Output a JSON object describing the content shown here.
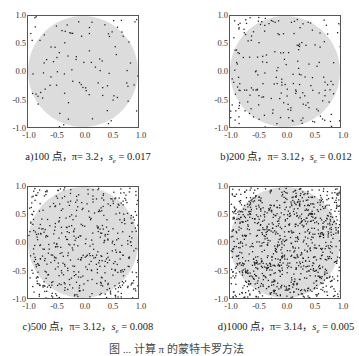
{
  "chart_data": [
    {
      "type": "scatter",
      "id": "a",
      "title": "a)100 点，π= 3.2，s_e = 0.017",
      "caption_prefix": "a)100 点，π= 3.2，",
      "caption_se_label": "s",
      "caption_se_sub": "e",
      "caption_se_value": " = 0.017",
      "n_points": 100,
      "pi_estimate": 3.2,
      "se": 0.017,
      "xlim": [
        -1.0,
        1.0
      ],
      "ylim": [
        -1.0,
        1.0
      ],
      "xticks": [
        "-1.0",
        "-0.5",
        "0.0",
        "0.5",
        "1.0"
      ],
      "yticks": [
        "1.0",
        "0.5",
        "0.0",
        "-0.5",
        "-1.0"
      ],
      "shaded_region": "unit circle",
      "seed": 11
    },
    {
      "type": "scatter",
      "id": "b",
      "title": "b)200 点，π= 3.12，s_e = 0.012",
      "caption_prefix": "b)200 点，π= 3.12，",
      "caption_se_label": "s",
      "caption_se_sub": "e",
      "caption_se_value": " = 0.012",
      "n_points": 200,
      "pi_estimate": 3.12,
      "se": 0.012,
      "xlim": [
        -1.0,
        1.0
      ],
      "ylim": [
        -1.0,
        1.0
      ],
      "xticks": [
        "-1.0",
        "-0.5",
        "0.0",
        "0.5",
        "1.0"
      ],
      "yticks": [
        "1.0",
        "0.5",
        "0.0",
        "-0.5",
        "-1.0"
      ],
      "shaded_region": "unit circle",
      "seed": 23
    },
    {
      "type": "scatter",
      "id": "c",
      "title": "c)500 点，π= 3.12，s_e = 0.008",
      "caption_prefix": "c)500 点，π= 3.12，",
      "caption_se_label": "s",
      "caption_se_sub": "e",
      "caption_se_value": " = 0.008",
      "n_points": 500,
      "pi_estimate": 3.12,
      "se": 0.008,
      "xlim": [
        -1.0,
        1.0
      ],
      "ylim": [
        -1.0,
        1.0
      ],
      "xticks": [
        "-1.0",
        "-0.5",
        "0.0",
        "0.5",
        "1.0"
      ],
      "yticks": [
        "1.0",
        "0.5",
        "0.0",
        "-0.5",
        "-1.0"
      ],
      "shaded_region": "unit circle",
      "seed": 37
    },
    {
      "type": "scatter",
      "id": "d",
      "title": "d)1000 点，π= 3.14，s_e = 0.005",
      "caption_prefix": "d)1000 点，π= 3.14，",
      "caption_se_label": "s",
      "caption_se_sub": "e",
      "caption_se_value": " = 0.005",
      "n_points": 1000,
      "pi_estimate": 3.14,
      "se": 0.005,
      "xlim": [
        -1.0,
        1.0
      ],
      "ylim": [
        -1.0,
        1.0
      ],
      "xticks": [
        "-1.0",
        "-0.5",
        "0.0",
        "0.5",
        "1.0"
      ],
      "yticks": [
        "1.0",
        "0.5",
        "0.0",
        "-0.5",
        "-1.0"
      ],
      "shaded_region": "unit circle",
      "seed": 53
    }
  ],
  "colors": {
    "circle_fill": "#dcdcdc",
    "point": "#1e1e1e",
    "frame": "#555555"
  },
  "figure_caption": "图 ... 计算 π 的蒙特卡罗方法"
}
